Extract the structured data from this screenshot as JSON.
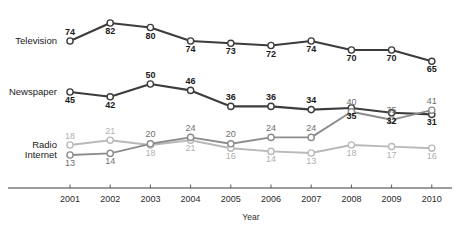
{
  "chart_data": {
    "type": "line",
    "title": "",
    "subtitle": "",
    "xlabel": "Year",
    "ylabel": "",
    "categories": [
      "2001",
      "2002",
      "2003",
      "2004",
      "2005",
      "2006",
      "2007",
      "2008",
      "2009",
      "2010"
    ],
    "x": [
      2001,
      2002,
      2003,
      2004,
      2005,
      2006,
      2007,
      2008,
      2009,
      2010
    ],
    "grid": false,
    "legend_position": "left-inline",
    "ylim": [
      0,
      100
    ],
    "axis_note": "broken/compressed vertical scale; series bands drawn separately",
    "series": [
      {
        "name": "Television",
        "color": "#3c3c3c",
        "label_color": "#1a1a1a",
        "values": [
          74,
          82,
          80,
          74,
          73,
          72,
          74,
          70,
          70,
          65
        ],
        "label_positions": [
          "above",
          "below",
          "below",
          "below",
          "below",
          "below",
          "below",
          "below",
          "below",
          "below"
        ]
      },
      {
        "name": "Newspaper",
        "color": "#3c3c3c",
        "label_color": "#1a1a1a",
        "values": [
          45,
          42,
          50,
          46,
          36,
          36,
          34,
          35,
          32,
          31
        ],
        "label_positions": [
          "below",
          "below",
          "above",
          "above",
          "above",
          "above",
          "above",
          "below",
          "below",
          "below"
        ]
      },
      {
        "name": "Radio",
        "color": "#b9b9b9",
        "label_color": "#b0b0b0",
        "values": [
          18,
          21,
          18,
          21,
          16,
          14,
          13,
          18,
          17,
          16
        ],
        "label_positions": [
          "above",
          "above",
          "below",
          "below",
          "below",
          "below",
          "below",
          "below",
          "below",
          "below"
        ]
      },
      {
        "name": "Internet",
        "color": "#8c8c8c",
        "label_color": "#6f6f6f",
        "values": [
          13,
          14,
          20,
          24,
          20,
          24,
          24,
          40,
          35,
          41
        ],
        "label_positions": [
          "below",
          "below",
          "above",
          "above",
          "above",
          "above",
          "above",
          "above",
          "above",
          "above"
        ]
      }
    ]
  },
  "axis": {
    "x_ticks": [
      "2001",
      "2002",
      "2003",
      "2004",
      "2005",
      "2006",
      "2007",
      "2008",
      "2009",
      "2010"
    ],
    "x_title": "Year"
  },
  "series_labels": {
    "television": "Television",
    "newspaper": "Newspaper",
    "radio": "Radio",
    "internet": "Internet"
  },
  "colors": {
    "television": "#3c3c3c",
    "newspaper": "#3c3c3c",
    "radio": "#b9b9b9",
    "internet": "#8c8c8c",
    "axis": "#3a3a3a",
    "background": "#ffffff"
  }
}
